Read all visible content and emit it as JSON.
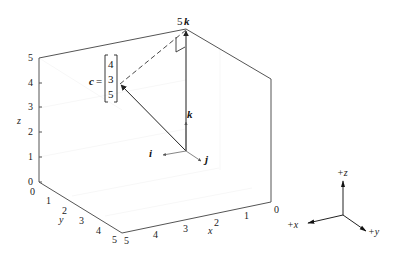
{
  "figure": {
    "z_axis": {
      "label": "z",
      "ticks": [
        "0",
        "1",
        "2",
        "3",
        "4",
        "5"
      ]
    },
    "y_axis": {
      "label": "y",
      "ticks": [
        "0",
        "1",
        "2",
        "3",
        "4",
        "5"
      ]
    },
    "x_axis": {
      "label": "x",
      "ticks": [
        "0",
        "1",
        "2",
        "3",
        "4",
        "5"
      ]
    },
    "vectors": {
      "i": "i",
      "j": "j",
      "k": "k",
      "five_k": "5k",
      "c_name": "c",
      "c_eq": "=",
      "c_components": [
        "4",
        "3",
        "5"
      ]
    },
    "orientation_triad": {
      "plus_x": "+x",
      "plus_y": "+y",
      "plus_z": "+z"
    }
  }
}
